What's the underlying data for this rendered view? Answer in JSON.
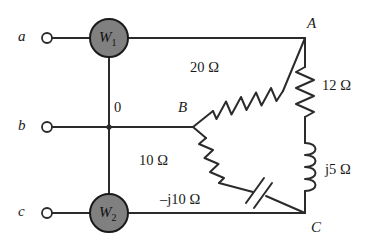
{
  "diagram": {
    "line_color": "#2b2b2b",
    "meter_fill": "#808080",
    "meter_stroke": "#1a1a1a",
    "terminals": [
      {
        "id": "a",
        "label": "a",
        "x": 22,
        "y": 38
      },
      {
        "id": "b",
        "label": "b",
        "x": 22,
        "y": 127
      },
      {
        "id": "c",
        "label": "c",
        "x": 22,
        "y": 213
      }
    ],
    "meters": [
      {
        "id": "w1",
        "label": "W",
        "subscript": "1",
        "cx": 109,
        "cy": 38,
        "r": 19
      },
      {
        "id": "w2",
        "label": "W",
        "subscript": "2",
        "cx": 109,
        "cy": 213,
        "r": 19
      }
    ],
    "nodes": [
      {
        "id": "zero",
        "label": "0",
        "x": 114,
        "y": 100
      },
      {
        "id": "A",
        "label": "A",
        "x": 307,
        "y": 16
      },
      {
        "id": "B",
        "label": "B",
        "x": 178,
        "y": 100
      },
      {
        "id": "C",
        "label": "C",
        "x": 311,
        "y": 220
      }
    ],
    "components": [
      {
        "id": "r20",
        "type": "resistor",
        "label": "20 Ω",
        "value": "20",
        "unit": "Ω",
        "label_x": 190,
        "label_y": 60,
        "between": [
          "B",
          "A"
        ]
      },
      {
        "id": "r12",
        "type": "resistor",
        "label": "12 Ω",
        "value": "12",
        "unit": "Ω",
        "label_x": 322,
        "label_y": 78,
        "between": [
          "A",
          "Lj5"
        ]
      },
      {
        "id": "lj5",
        "type": "inductor",
        "label": "j5 Ω",
        "value": "j5",
        "unit": "Ω",
        "label_x": 325,
        "label_y": 162,
        "between": [
          "r12",
          "C"
        ]
      },
      {
        "id": "r10",
        "type": "resistor",
        "label": "10 Ω",
        "value": "10",
        "unit": "Ω",
        "label_x": 139,
        "label_y": 153,
        "between": [
          "B",
          "Cap"
        ]
      },
      {
        "id": "cneg10",
        "type": "capacitor",
        "label": "–j10 Ω",
        "value": "–j10",
        "unit": "Ω",
        "label_x": 160,
        "label_y": 192,
        "between": [
          "r10",
          "C"
        ]
      }
    ]
  }
}
